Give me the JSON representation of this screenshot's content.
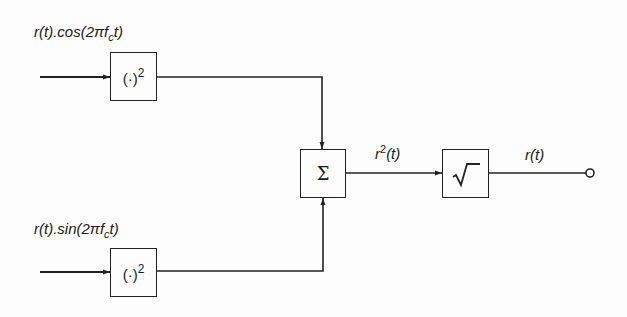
{
  "diagram": {
    "inputs": [
      {
        "label_prefix": "r(t).cos(2πf",
        "label_sub": "c",
        "label_suffix": "t)"
      },
      {
        "label_prefix": "r(t).sin(2πf",
        "label_sub": "c",
        "label_suffix": "t)"
      }
    ],
    "blocks": {
      "square_top": {
        "label": "(·)",
        "sup": "2"
      },
      "square_bottom": {
        "label": "(·)",
        "sup": "2"
      },
      "summer": {
        "label": "Σ"
      },
      "sqrt": {
        "label": "√‾"
      }
    },
    "signals": {
      "sum_output_base": "r",
      "sum_output_sup": "2",
      "sum_output_suffix": "(t)",
      "final_output": "r(t)"
    }
  }
}
